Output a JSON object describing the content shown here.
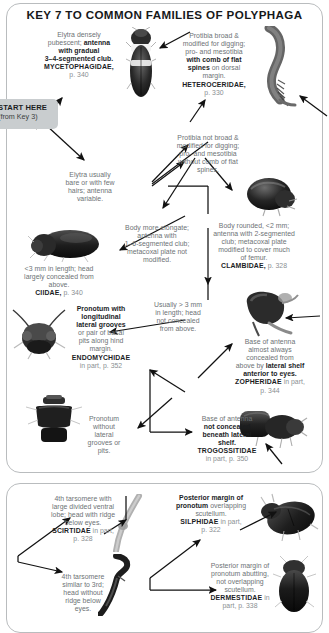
{
  "page": {
    "title": "KEY 7 TO COMMON FAMILIES OF POLYPHAGA"
  },
  "start": {
    "label": "START HERE",
    "sublabel": "(from Key 3)"
  },
  "nodes": {
    "mycetophagidae": {
      "text_lead": "Elytra densely",
      "text_1": "pubescent; ",
      "text_1b": "antenna",
      "text_2": "with gradual",
      "text_3": "3–4-segmented club.",
      "family": "MYCETOPHAGIDAE,",
      "page": "p. 340",
      "full": "Elytra densely pubescent; antenna with gradual 3–4-segmented club. MYCETOPHAGIDAE, p. 340"
    },
    "heteroceridae": {
      "text_1": "Protibia broad &",
      "text_2": "modified for digging;",
      "text_3": "pro- and mesotibia",
      "text_4b": "with comb of flat",
      "text_5b": "spines",
      "text_5": " on dorsal",
      "text_6": "margin.",
      "family": "HETEROCERIDAE,",
      "page": "p. 330",
      "full": "Protibia broad & modified for digging; pro- and mesotibia with comb of flat spines on dorsal margin. HETEROCERIDAE, p. 330"
    },
    "elytra_bare": {
      "text_1": "Elytra usually",
      "text_2": "bare or with few",
      "text_3": "hairs; antenna",
      "text_4": "variable.",
      "full": "Elytra usually bare or with few hairs; antenna variable."
    },
    "protibia_not_broad": {
      "text_1": "Protibia not broad &",
      "text_2": "modified for digging;",
      "text_3": "pro- and mesotibia",
      "text_4": "without comb of flat",
      "text_5": "spines.",
      "full": "Protibia not broad & modified for digging; pro- and mesotibia without comb of flat spines."
    },
    "body_elongate": {
      "text_1": "Body more elongate;",
      "text_2": "antenna with",
      "text_3": "1–6-segmented club;",
      "text_4": "metacoxal plate not",
      "text_5": "modified.",
      "full": "Body more elongate; antenna with 1–6-segmented club; metacoxal plate not modified."
    },
    "clambidae": {
      "text_1": "Body rounded, <2 mm;",
      "text_2": "antenna with 2-segmented",
      "text_3": "club; metacoxal plate",
      "text_4": "modified to cover much",
      "text_5": "of femur.",
      "family": "CLAMBIDAE,",
      "page": "p. 328",
      "full": "Body rounded, <2 mm; antenna with 2-segmented club; metacoxal plate modified to cover much of femur. CLAMBIDAE, p. 328"
    },
    "ciidae": {
      "text_1": "<3 mm in length; head",
      "text_2": "largely concealed from",
      "text_3": "above.",
      "family": "CIIDAE,",
      "page": "p. 340",
      "full": "<3 mm in length; head largely concealed from above. CIIDAE, p. 340"
    },
    "usually_3mm": {
      "text_1": "Usually > 3 mm",
      "text_2": "in length; head",
      "text_3": "not concealed",
      "text_4": "from above.",
      "full": "Usually > 3 mm in length; head not concealed from above."
    },
    "endomychidae": {
      "text_1b": "Pronotum with",
      "text_2b": "longitudinal",
      "text_3b": "lateral grooves",
      "text_4": "or pair of basal",
      "text_5": "pits along hind",
      "text_6": "margin.",
      "family": "ENDOMYCHIDAE",
      "page": "in part, p. 352",
      "full": "Pronotum with longitudinal lateral grooves or pair of basal pits along hind margin. ENDOMYCHIDAE in part, p. 352"
    },
    "zopheridae": {
      "text_1": "Base of antenna",
      "text_2": "almost always",
      "text_3": "concealed from",
      "text_4": "above by ",
      "text_4b": "lateral shelf",
      "text_5b": "anterior to eyes.",
      "family": "ZOPHERIDAE",
      "page_pre": " in part,",
      "page": "p. 344",
      "full": "Base of antenna almost always concealed from above by lateral shelf anterior to eyes. ZOPHERIDAE in part, p. 344"
    },
    "pronotum_without": {
      "text_1": "Pronotum",
      "text_2": "without",
      "text_3": "lateral",
      "text_4": "grooves or",
      "text_5": "pits.",
      "full": "Pronotum without lateral grooves or pits."
    },
    "trogossitidae": {
      "text_1": "Base of antenna",
      "text_2b": "not concealed",
      "text_3b": "beneath lateral",
      "text_4b": "shelf.",
      "family": "TROGOSSITIDAE",
      "page": "in part, p. 350",
      "full": "Base of antenna not concealed beneath lateral shelf. TROGOSSITIDAE in part, p. 350"
    },
    "scirtidae": {
      "text_1": "4th tarsomere with",
      "text_2": "large divided ventral",
      "text_3": "lobe; head with ridge",
      "text_4": "below eyes.",
      "family": "SCIRTIDAE",
      "page": " in part,",
      "page2": "p. 328",
      "full": "4th tarsomere with large divided ventral lobe; head with ridge below eyes. SCIRTIDAE in part, p. 328"
    },
    "tarsomere_similar": {
      "text_1": "4th tarsomere",
      "text_2": "similar to 3rd;",
      "text_3": "head without",
      "text_4": "ridge below",
      "text_5": "eyes.",
      "full": "4th tarsomere similar to 3rd; head without ridge below eyes."
    },
    "silphidae": {
      "text_1b": "Posterior margin of",
      "text_2b": "pronotum",
      "text_2": " overlapping",
      "text_3": "scutellum.",
      "family": "SILPHIDAE",
      "page": " in part,",
      "page2": "p. 322",
      "full": "Posterior margin of pronotum overlapping scutellum. SILPHIDAE in part, p. 322"
    },
    "dermestidae": {
      "text_1": "Posterior margin of",
      "text_2": "pronotum abutting,",
      "text_3": "not overlapping",
      "text_4": "scutellum.",
      "family": "DERMESTIDAE",
      "page": " in",
      "page2": "part, p. 338",
      "full": "Posterior margin of pronotum abutting, not overlapping scutellum. DERMESTIDAE in part, p. 338"
    }
  },
  "specimens": [
    {
      "name": "mycetophagidae-beetle-photo"
    },
    {
      "name": "heteroceridae-tibia-photo"
    },
    {
      "name": "ciidae-beetle-photo"
    },
    {
      "name": "clambidae-beetle-photo"
    },
    {
      "name": "endomychidae-beetle-photo"
    },
    {
      "name": "zopheridae-head-photo"
    },
    {
      "name": "pronotum-without-grooves-photo"
    },
    {
      "name": "trogossitidae-beetle-photo"
    },
    {
      "name": "scirtidae-tarsus-photo"
    },
    {
      "name": "tarsomere-similar-photo"
    },
    {
      "name": "silphidae-beetle-photo"
    },
    {
      "name": "dermestidae-beetle-photo"
    }
  ],
  "colors": {
    "text_grey": "#6d7275",
    "text_dark": "#1b1d1f",
    "panel_border": "#b9bcbe",
    "start_tag_bg": "#c9cdcf"
  }
}
